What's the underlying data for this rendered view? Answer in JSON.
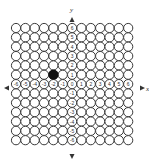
{
  "diagram": {
    "type": "coordinate-grid-of-circles",
    "x_axis_label": "x",
    "y_axis_label": "y",
    "x_range": [
      -6,
      6
    ],
    "y_range": [
      -6,
      6
    ],
    "grid_columns": 13,
    "grid_rows": 13,
    "x_tick_labels": [
      "-6",
      "-5",
      "-4",
      "-3",
      "-2",
      "-1",
      "0",
      "1",
      "2",
      "3",
      "4",
      "5",
      "6"
    ],
    "y_tick_labels": [
      "6",
      "5",
      "4",
      "3",
      "2",
      "1",
      "0",
      "-1",
      "-2",
      "-3",
      "-4",
      "-5",
      "-6"
    ],
    "highlighted_point": {
      "x": -2,
      "y": 1,
      "color": "#111111"
    },
    "colors": {
      "circle_stroke": "#3a3a3a",
      "circle_fill": "#ffffff",
      "background": "#ffffff"
    }
  }
}
